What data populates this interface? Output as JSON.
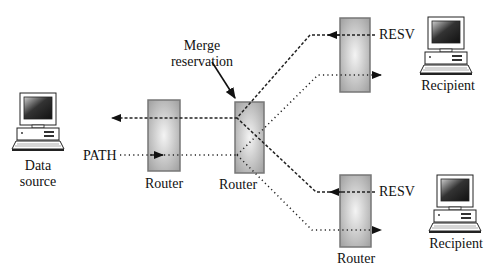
{
  "diagram": {
    "nodes": {
      "source": {
        "label_line1": "Data",
        "label_line2": "source"
      },
      "router1": {
        "label": "Router"
      },
      "router2": {
        "label": "Router"
      },
      "router3": {
        "label": ""
      },
      "router4": {
        "label": "Router"
      },
      "recipient_top": {
        "label": "Recipient"
      },
      "recipient_bottom": {
        "label": "Recipient"
      }
    },
    "annotations": {
      "merge_line1": "Merge",
      "merge_line2": "reservation",
      "path": "PATH",
      "resv_top": "RESV",
      "resv_bottom": "RESV"
    },
    "legend": {
      "dashed": "RESV message (upstream)",
      "dotted": "PATH message (downstream)"
    },
    "colors": {
      "router_edge": "#777777",
      "router_fill_light": "#f0f0f0",
      "router_fill_dark": "#a8a8a8",
      "line": "#222222"
    }
  }
}
